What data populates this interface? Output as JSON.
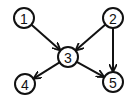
{
  "diagram": {
    "type": "directed-graph",
    "colors": {
      "stroke": "#111111",
      "background": "#ffffff",
      "node_fill": "#ffffff"
    },
    "node_radius": 10,
    "nodes": [
      {
        "id": "1",
        "label": "1",
        "x": 24,
        "y": 18
      },
      {
        "id": "2",
        "label": "2",
        "x": 113,
        "y": 18
      },
      {
        "id": "3",
        "label": "3",
        "x": 68,
        "y": 57
      },
      {
        "id": "4",
        "label": "4",
        "x": 25,
        "y": 84
      },
      {
        "id": "5",
        "label": "5",
        "x": 113,
        "y": 82
      }
    ],
    "edges": [
      {
        "from": "1",
        "to": "3"
      },
      {
        "from": "2",
        "to": "3"
      },
      {
        "from": "2",
        "to": "5"
      },
      {
        "from": "3",
        "to": "4"
      },
      {
        "from": "3",
        "to": "5"
      }
    ]
  }
}
